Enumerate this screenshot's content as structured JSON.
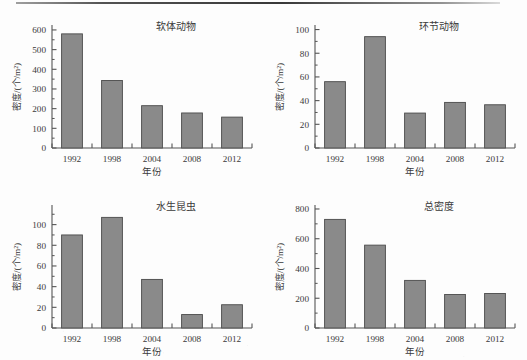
{
  "page": {
    "background_color": "#fdfdfd",
    "ink_color": "#3a3a3a",
    "bar_fill_color": "#8a8a8a",
    "bar_stroke_color": "#4a4a4a",
    "axis_color": "#555555",
    "scan_artifact_top_line": true
  },
  "chart_data": [
    {
      "type": "bar",
      "title": "软体动物",
      "xlabel": "年份",
      "ylabel": "密度/(个/m²)",
      "categories": [
        "1992",
        "1998",
        "2004",
        "2008",
        "2012"
      ],
      "values": [
        580,
        343,
        215,
        178,
        157
      ],
      "yticks": [
        0,
        100,
        200,
        300,
        400,
        500,
        600
      ],
      "ytick_labels": [
        "0",
        "100",
        "200",
        "300",
        "400",
        "500",
        "600"
      ],
      "ylim": [
        0,
        620
      ],
      "minor_ticks": true,
      "grid": false,
      "legend": "none"
    },
    {
      "type": "bar",
      "title": "环节动物",
      "xlabel": "年份",
      "ylabel": "密度/(个/m²)",
      "categories": [
        "1992",
        "1998",
        "2004",
        "2008",
        "2012"
      ],
      "values": [
        56,
        94,
        29.5,
        38.5,
        36.5
      ],
      "yticks": [
        0,
        20,
        40,
        60,
        80,
        100
      ],
      "ytick_labels": [
        "0",
        "20",
        "40",
        "60",
        "80",
        "100"
      ],
      "ylim": [
        0,
        103
      ],
      "minor_ticks": true,
      "grid": false,
      "legend": "none"
    },
    {
      "type": "bar",
      "title": "水生昆虫",
      "xlabel": "年份",
      "ylabel": "密度/(个/m²)",
      "categories": [
        "1992",
        "1998",
        "2004",
        "2008",
        "2012"
      ],
      "values": [
        90,
        107,
        47,
        13,
        22.5
      ],
      "yticks": [
        0,
        20,
        40,
        60,
        80,
        100
      ],
      "ytick_labels": [
        "0",
        "20",
        "40",
        "60",
        "80",
        "100"
      ],
      "ylim": [
        0,
        118
      ],
      "minor_ticks": true,
      "grid": false,
      "legend": "none"
    },
    {
      "type": "bar",
      "title": "总密度",
      "xlabel": "年份",
      "ylabel": "密度/(个/m²)",
      "categories": [
        "1992",
        "1998",
        "2004",
        "2008",
        "2012"
      ],
      "values": [
        730,
        557,
        320,
        225,
        232
      ],
      "yticks": [
        0,
        200,
        400,
        600,
        800
      ],
      "ytick_labels": [
        "0",
        "200",
        "400",
        "600",
        "800"
      ],
      "ylim": [
        0,
        820
      ],
      "minor_ticks": true,
      "grid": false,
      "legend": "none"
    }
  ]
}
